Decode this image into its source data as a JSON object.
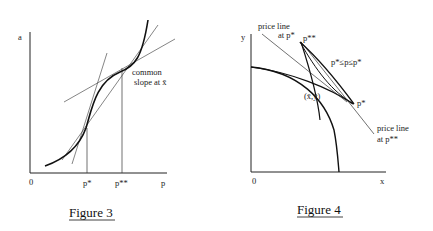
{
  "figure3": {
    "caption": "Figure 3",
    "y_axis_label": "a",
    "x_axis_label": "p",
    "origin_label": "0",
    "tick_p_star": "p*",
    "tick_p_double_star": "p**",
    "annotation_line1": "common",
    "annotation_line2": "slope at x̄"
  },
  "figure4": {
    "caption": "Figure 4",
    "y_axis_label": "y",
    "x_axis_label": "x",
    "origin_label": "0",
    "price_line_p_star_line1": "price line",
    "price_line_p_star_line2": "at p*",
    "price_line_p_double_star_line1": "price line",
    "price_line_p_double_star_line2": "at p**",
    "point_p_double_star": "p**",
    "point_p_star": "p*",
    "range_label": "p*≤p≤p*",
    "point_xy": "(x̄,ȳ)"
  },
  "colors": {
    "ink": "#1a1a1a",
    "background": "#ffffff"
  }
}
